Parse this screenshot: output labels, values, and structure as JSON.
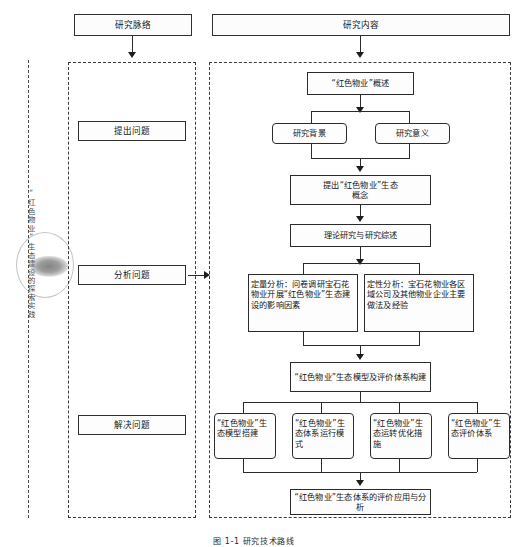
{
  "figure": {
    "caption": "图 1-1  研究技术路线",
    "side_label": "“红色物业”生态建设的探索实践"
  },
  "columns": {
    "left_header": "研究脉络",
    "right_header": "研究内容"
  },
  "stages": [
    {
      "id": "stage-raise",
      "label": "提出问题"
    },
    {
      "id": "stage-analyze",
      "label": "分析问题"
    },
    {
      "id": "stage-solve",
      "label": "解决问题"
    }
  ],
  "nodes": {
    "overview": "“红色物业”概述",
    "background": "研究背景",
    "significance": "研究意义",
    "concept": "提出“红色物业”生态\n概念",
    "review": "理论研究与研究综述",
    "quantitative": "定量分析：问卷调研宝石花物业开展“红色物业”生态建设的影响因素",
    "qualitative": "定性分析：宝石花物业各区域公司及其他物业企业主要做法及经验",
    "model_build": "“红色物业”生态模型及评价体系构建",
    "outcome1": "“红色物业”生态模型搭建",
    "outcome2": "“红色物业”生态体系运行模式",
    "outcome3": "“红色物业”生态运转优化措施",
    "outcome4": "“红色物业”生态评价体系",
    "final": "“红色物业”生态体系的评价应用与分析"
  },
  "colors": {
    "stroke": "#2b2b2b",
    "dashed": "#3a3a3a",
    "arrow": "#1d1d1d",
    "text": "#161616",
    "background": "#ffffff"
  }
}
